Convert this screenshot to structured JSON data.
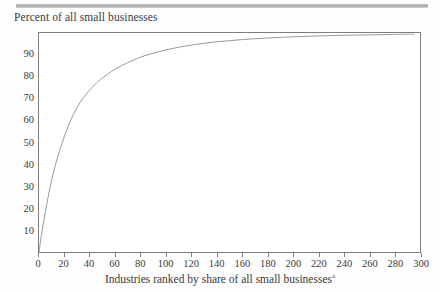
{
  "chart_data": {
    "type": "line",
    "title": "Percent of all small businesses",
    "xlabel": "Industries ranked by share of all small businesses",
    "xlabel_footnote_marker": "a",
    "ylabel": "",
    "xlim": [
      0,
      300
    ],
    "ylim": [
      0,
      100
    ],
    "xticks": [
      0,
      20,
      40,
      60,
      80,
      100,
      120,
      140,
      160,
      180,
      200,
      220,
      240,
      260,
      280,
      300
    ],
    "yticks": [
      10,
      20,
      30,
      40,
      50,
      60,
      70,
      80,
      90
    ],
    "grid": false,
    "legend": null,
    "series": [
      {
        "name": "Cumulative percent of all small businesses",
        "x": [
          0,
          2,
          4,
          6,
          8,
          10,
          14,
          18,
          22,
          26,
          30,
          35,
          40,
          45,
          50,
          60,
          70,
          80,
          90,
          100,
          110,
          120,
          130,
          140,
          150,
          160,
          170,
          180,
          190,
          200,
          210,
          220,
          230,
          240,
          250,
          260,
          270,
          280,
          290,
          295
        ],
        "y": [
          0,
          8,
          15,
          21.5,
          27.5,
          33,
          42,
          49.5,
          56,
          61.5,
          66,
          70.5,
          74,
          77,
          79.5,
          83.5,
          86.5,
          89,
          90.8,
          92.3,
          93.5,
          94.5,
          95.3,
          96,
          96.5,
          97,
          97.4,
          97.7,
          98,
          98.25,
          98.45,
          98.65,
          98.8,
          98.95,
          99.05,
          99.15,
          99.25,
          99.35,
          99.45,
          99.5
        ]
      }
    ],
    "line_color": "#8f8f8f",
    "frame_color": "#7d7d7d"
  }
}
